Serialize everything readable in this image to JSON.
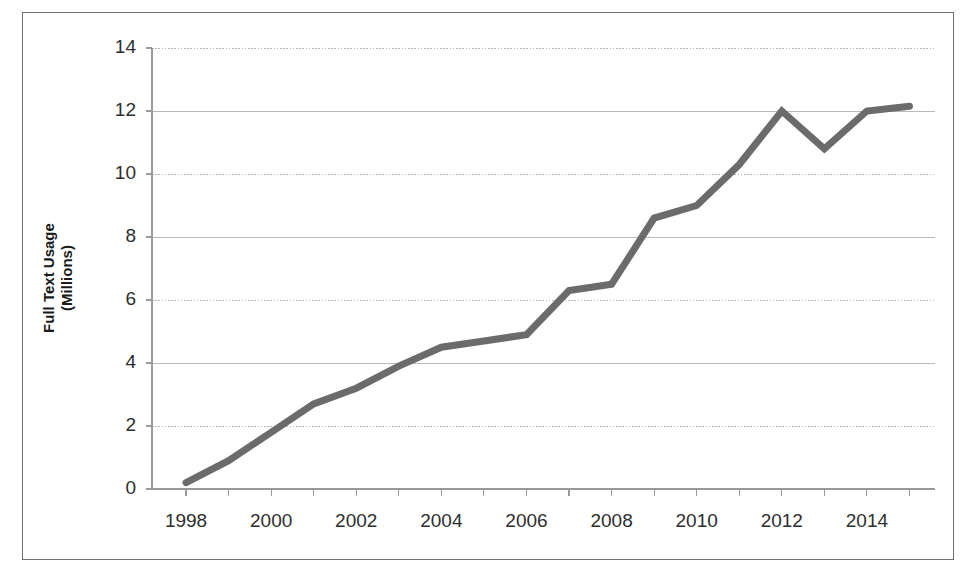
{
  "chart_data": {
    "type": "line",
    "title": "",
    "xlabel": "",
    "ylabel_line1": "Full Text Usage",
    "ylabel_line2": "(Millions)",
    "ylabel": "Full Text Usage (Millions)",
    "ylim": [
      0,
      14
    ],
    "xlim": [
      1997.2,
      2015.6
    ],
    "ytick_labels": [
      "0",
      "2",
      "4",
      "6",
      "8",
      "10",
      "12",
      "14"
    ],
    "ytick_values": [
      0,
      2,
      4,
      6,
      8,
      10,
      12,
      14
    ],
    "xtick_labels": [
      "1998",
      "2000",
      "2002",
      "2004",
      "2006",
      "2008",
      "2010",
      "2012",
      "2014"
    ],
    "xtick_values": [
      1998,
      2000,
      2002,
      2004,
      2006,
      2008,
      2010,
      2012,
      2014
    ],
    "x_minor_ticks": [
      1997,
      1998,
      1999,
      2000,
      2001,
      2002,
      2003,
      2004,
      2005,
      2006,
      2007,
      2008,
      2009,
      2010,
      2011,
      2012,
      2013,
      2014,
      2015
    ],
    "grid": "horizontal",
    "legend": "none",
    "series": [
      {
        "name": "Full Text Usage",
        "color": "#6b6b6b",
        "line_width": 7,
        "x": [
          1998,
          1999,
          2000,
          2001,
          2002,
          2003,
          2004,
          2005,
          2006,
          2007,
          2008,
          2009,
          2010,
          2011,
          2012,
          2013,
          2014,
          2015
        ],
        "values": [
          0.2,
          0.9,
          1.8,
          2.7,
          3.2,
          3.9,
          4.5,
          4.7,
          4.9,
          6.3,
          6.5,
          8.6,
          9.0,
          10.3,
          12.0,
          10.8,
          12.0,
          12.15
        ]
      }
    ]
  },
  "axes": {
    "ytick_labels": [
      "14",
      "12",
      "10",
      "8",
      "6",
      "4",
      "2",
      "0"
    ],
    "xtick_labels": [
      "1998",
      "2000",
      "2002",
      "2004",
      "2006",
      "2008",
      "2010",
      "2012",
      "2014"
    ]
  },
  "colors": {
    "line": "#6b6b6b",
    "grid": "#b9b9b9",
    "axis": "#9a9a9a",
    "text": "#2e2e2e",
    "page_border": "#6f6f6f"
  }
}
